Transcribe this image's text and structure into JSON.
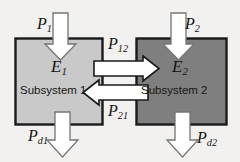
{
  "figure": {
    "background_color": "#f2f1ef",
    "boxes": [
      {
        "id": "subsystem-1",
        "caption": "Subsystem 1",
        "energy_label": "E",
        "energy_sub": "1",
        "fill": "#c9c9c9",
        "stroke": "#1a1a1a"
      },
      {
        "id": "subsystem-2",
        "caption": "Subsystem 2",
        "energy_label": "E",
        "energy_sub": "2",
        "fill": "#7f7f7f",
        "stroke": "#1a1a1a"
      }
    ],
    "arrows": [
      {
        "id": "input-power-1",
        "label": "P",
        "sub": "1",
        "direction": "down",
        "fill": "#ffffff",
        "stroke": "#6e6e6e"
      },
      {
        "id": "input-power-2",
        "label": "P",
        "sub": "2",
        "direction": "down",
        "fill": "#ffffff",
        "stroke": "#6e6e6e"
      },
      {
        "id": "coupling-power-12",
        "label": "P",
        "sub": "12",
        "direction": "right",
        "fill": "#ffffff",
        "stroke": "#1a1a1a"
      },
      {
        "id": "coupling-power-21",
        "label": "P",
        "sub": "21",
        "direction": "left",
        "fill": "#ffffff",
        "stroke": "#1a1a1a"
      },
      {
        "id": "dissipated-power-1",
        "label": "P",
        "sub": "d1",
        "direction": "down",
        "fill": "#ffffff",
        "stroke": "#6e6e6e"
      },
      {
        "id": "dissipated-power-2",
        "label": "P",
        "sub": "d2",
        "direction": "down",
        "fill": "#ffffff",
        "stroke": "#6e6e6e"
      }
    ]
  },
  "labels": {
    "p1": {
      "base": "P",
      "sub": "1"
    },
    "p2": {
      "base": "P",
      "sub": "2"
    },
    "p12": {
      "base": "P",
      "sub": "12"
    },
    "p21": {
      "base": "P",
      "sub": "21"
    },
    "e1": {
      "base": "E",
      "sub": "1"
    },
    "e2": {
      "base": "E",
      "sub": "2"
    },
    "pd1": {
      "base": "P",
      "sub": "d1"
    },
    "pd2": {
      "base": "P",
      "sub": "d2"
    },
    "subsystem1": "Subsystem 1",
    "subsystem2": "Subsystem 2"
  }
}
